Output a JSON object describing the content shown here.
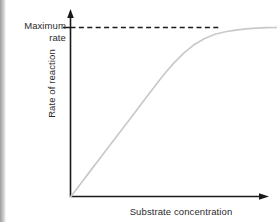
{
  "chart_data": {
    "type": "line",
    "title": "",
    "subtitle": "",
    "xlabel": "Substrate concentration",
    "ylabel": "Rate of reaction",
    "grid": false,
    "legend": null,
    "axis_ticks": {
      "x": [],
      "y": []
    },
    "xlim": [
      0,
      1
    ],
    "ylim": [
      0,
      1.06
    ],
    "annotations": [
      {
        "name": "maximum-rate",
        "line1": "Maximum",
        "line2": "rate",
        "text": "Maximum rate",
        "y_value": 1.0,
        "style": "dashed-horizontal-line-with-axis-tick"
      }
    ],
    "series": [
      {
        "name": "Michaelis-Menten saturation curve",
        "color": "#c9c9c9",
        "x": [
          0.0,
          0.05,
          0.1,
          0.15,
          0.2,
          0.25,
          0.3,
          0.35,
          0.4,
          0.45,
          0.5,
          0.55,
          0.6,
          0.65,
          0.7,
          0.75,
          0.8,
          0.85,
          0.9,
          0.95,
          1.0
        ],
        "y": [
          0.0,
          0.08,
          0.16,
          0.24,
          0.32,
          0.4,
          0.48,
          0.56,
          0.64,
          0.72,
          0.79,
          0.85,
          0.9,
          0.935,
          0.96,
          0.975,
          0.985,
          0.992,
          0.996,
          0.999,
          1.0
        ]
      }
    ],
    "reference_lines": [
      {
        "name": "maximum-rate-dashed-line",
        "orientation": "horizontal",
        "y_value": 1.0,
        "x_from": 0.0,
        "x_to": 0.76,
        "color": "#1a1a1a",
        "dash": "5 3"
      }
    ],
    "colors": {
      "curve": "#c9c9c9",
      "axis": "#1a1a1a",
      "dashed_line": "#1a1a1a",
      "text": "#2b2b2b",
      "background": "#ffffff"
    }
  }
}
